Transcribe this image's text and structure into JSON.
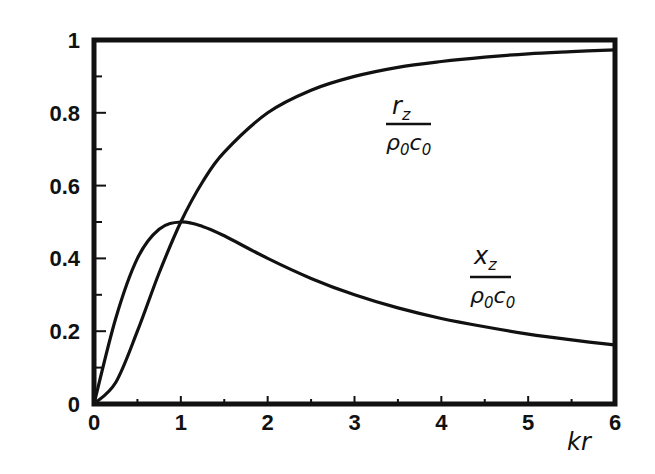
{
  "chart_data": {
    "type": "line",
    "title": "",
    "xlabel": "kr",
    "ylabel": "",
    "xlim": [
      0,
      6
    ],
    "ylim": [
      0,
      1
    ],
    "grid": false,
    "legend": "inline curve labels",
    "x_ticks": [
      "0",
      "1",
      "2",
      "3",
      "4",
      "5",
      "6"
    ],
    "y_ticks": [
      "0",
      "0.2",
      "0.4",
      "0.6",
      "0.8",
      "1"
    ],
    "x": [
      0,
      0.25,
      0.5,
      0.75,
      1,
      1.25,
      1.5,
      2,
      2.5,
      3,
      3.5,
      4,
      4.5,
      5,
      5.5,
      6
    ],
    "series": [
      {
        "name": "r_z / (ρ0 c0)",
        "label_numerator": "r",
        "label_numerator_sub": "z",
        "label_denominator": "ρ",
        "label_denominator_sub1": "0",
        "label_denominator_c": "c",
        "label_denominator_sub2": "0",
        "values": [
          0,
          0.059,
          0.2,
          0.36,
          0.5,
          0.61,
          0.692,
          0.8,
          0.862,
          0.9,
          0.925,
          0.941,
          0.953,
          0.962,
          0.968,
          0.973
        ]
      },
      {
        "name": "x_z / (ρ0 c0)",
        "label_numerator": "x",
        "label_numerator_sub": "z",
        "label_denominator": "ρ",
        "label_denominator_sub1": "0",
        "label_denominator_c": "c",
        "label_denominator_sub2": "0",
        "values": [
          0,
          0.235,
          0.4,
          0.48,
          0.5,
          0.488,
          0.462,
          0.4,
          0.345,
          0.3,
          0.264,
          0.235,
          0.212,
          0.192,
          0.176,
          0.162
        ]
      }
    ]
  }
}
